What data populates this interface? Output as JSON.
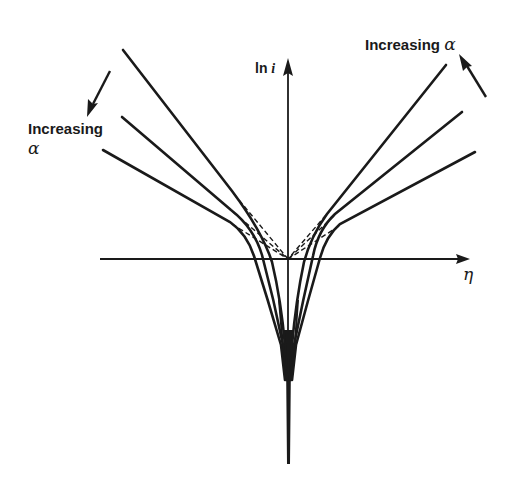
{
  "diagram": {
    "title": "",
    "axes": {
      "vertical_label_prefix": "ln ",
      "vertical_label_var": "i",
      "horizontal_label": "η"
    },
    "annotations": {
      "left": {
        "text": "Increasing",
        "symbol": "α",
        "direction": "arrow pointing down-left (outward toward flatter curves)"
      },
      "right": {
        "text": "Increasing ",
        "symbol": "α",
        "direction": "arrow pointing up-left (toward steeper curves)"
      }
    },
    "curves": {
      "count_per_branch": 3,
      "style": "solid",
      "linear_extrapolations": "dashed (Tafel lines meeting at origin)",
      "color": "#1a1a1a"
    }
  }
}
